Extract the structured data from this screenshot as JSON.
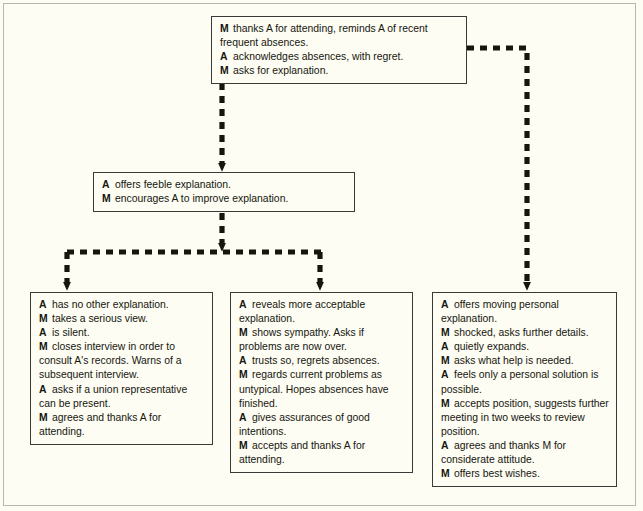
{
  "diagram": {
    "background_color": "#fdfdf3",
    "line_color": "#16160f",
    "box_border_color": "#3a3a38",
    "connector_style": "dashed",
    "nodes": [
      {
        "id": "opening",
        "name": "opening-node",
        "lines": [
          {
            "who": "M",
            "text": "thanks A for attending, reminds A of recent frequent absences."
          },
          {
            "who": "A",
            "text": "acknowledges absences, with regret."
          },
          {
            "who": "M",
            "text": "asks for explanation."
          }
        ]
      },
      {
        "id": "feeble",
        "name": "feeble-explanation-node",
        "lines": [
          {
            "who": "A",
            "text": "offers feeble explanation."
          },
          {
            "who": "M",
            "text": "encourages A to improve explanation."
          }
        ]
      },
      {
        "id": "no-explanation",
        "name": "no-explanation-outcome-node",
        "lines": [
          {
            "who": "A",
            "text": "has no other explanation."
          },
          {
            "who": "M",
            "text": "takes a serious view."
          },
          {
            "who": "A",
            "text": "is silent."
          },
          {
            "who": "M",
            "text": "closes interview in order to consult A's records. Warns of a subsequent interview."
          },
          {
            "who": "A",
            "text": "asks if a union representative can be present."
          },
          {
            "who": "M",
            "text": "agrees and thanks A for attending."
          }
        ]
      },
      {
        "id": "acceptable-explanation",
        "name": "acceptable-explanation-outcome-node",
        "lines": [
          {
            "who": "A",
            "text": "reveals more acceptable explanation."
          },
          {
            "who": "M",
            "text": "shows sympathy. Asks if problems are now over."
          },
          {
            "who": "A",
            "text": "trusts so, regrets absences."
          },
          {
            "who": "M",
            "text": "regards current problems as untypical. Hopes absences have finished."
          },
          {
            "who": "A",
            "text": "gives assurances of good intentions."
          },
          {
            "who": "M",
            "text": "accepts and thanks A for attending."
          }
        ]
      },
      {
        "id": "personal-explanation",
        "name": "personal-explanation-outcome-node",
        "lines": [
          {
            "who": "A",
            "text": "offers moving personal explanation."
          },
          {
            "who": "M",
            "text": "shocked, asks further details."
          },
          {
            "who": "A",
            "text": "quietly expands."
          },
          {
            "who": "M",
            "text": "asks what help is needed."
          },
          {
            "who": "A",
            "text": "feels only a personal solution is possible."
          },
          {
            "who": "M",
            "text": "accepts position, suggests further meeting in two weeks to review position."
          },
          {
            "who": "A",
            "text": "agrees and thanks M for considerate attitude."
          },
          {
            "who": "M",
            "text": "offers best wishes."
          }
        ]
      }
    ],
    "connectors": [
      {
        "name": "opening-to-feeble-connector",
        "from": "opening",
        "to": "feeble"
      },
      {
        "name": "opening-to-personal-connector",
        "from": "opening",
        "to": "personal-explanation"
      },
      {
        "name": "feeble-to-split-connector",
        "from": "feeble",
        "to": "split-bar"
      },
      {
        "name": "split-to-no-explanation-connector",
        "from": "split-bar",
        "to": "no-explanation"
      },
      {
        "name": "split-to-acceptable-connector",
        "from": "split-bar",
        "to": "acceptable-explanation"
      }
    ]
  }
}
